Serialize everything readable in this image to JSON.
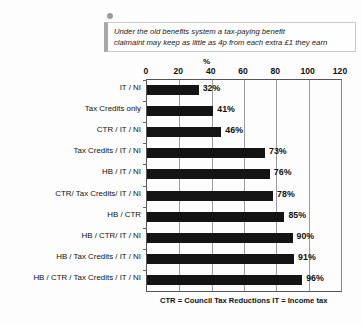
{
  "callout": {
    "icon": "bullet-dot",
    "lines": [
      "Under the old benefits system a tax-paying benefit",
      "claimaint may keep as little as 4p from each extra £1 they earn"
    ]
  },
  "footnote": "CTR = Council Tax Reductions  IT = Income tax",
  "chart_data": {
    "type": "bar",
    "orientation": "horizontal",
    "title": "",
    "xlabel": "%",
    "ylabel": "",
    "xlim": [
      0,
      120
    ],
    "xticks": [
      0,
      20,
      40,
      60,
      80,
      100,
      120
    ],
    "grid": true,
    "legend": false,
    "bar_color": "#141414",
    "categories": [
      "IT / NI",
      "Tax Credits only",
      "CTR / IT / NI",
      "Tax Credits / IT / NI",
      "HB / IT / NI",
      "CTR/ Tax Credits/ IT / NI",
      "HB / CTR",
      "HB / CTR/ IT / NI",
      "HB / Tax Credits / IT / NI",
      "HB / CTR / Tax Credits / IT / NI"
    ],
    "values": [
      32,
      41,
      46,
      73,
      76,
      78,
      85,
      90,
      91,
      96
    ],
    "value_labels": [
      "32%",
      "41%",
      "46%",
      "73%",
      "76%",
      "78%",
      "85%",
      "90%",
      "91%",
      "96%"
    ]
  }
}
